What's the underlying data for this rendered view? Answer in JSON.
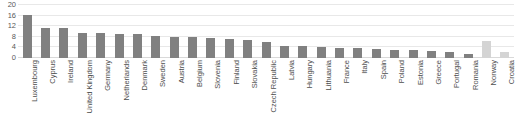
{
  "chart_data": {
    "type": "bar",
    "title": "",
    "subtitle": "",
    "xlabel": "",
    "ylabel": "",
    "ylim": [
      0,
      20
    ],
    "yticks": [
      0,
      4,
      8,
      12,
      16,
      20
    ],
    "grid": true,
    "legend": null,
    "categories": [
      "Luxembourg",
      "Cyprus",
      "Ireland",
      "United Kingdom",
      "Germany",
      "Netherlands",
      "Denmark",
      "Sweden",
      "Austria",
      "Belgium",
      "Slovenia",
      "Finland",
      "Slovakia",
      "Czech Republic",
      "Latvia",
      "Hungary",
      "Lithuania",
      "France",
      "Italy",
      "Spain",
      "Poland",
      "Estonia",
      "Greece",
      "Portugal",
      "Romania",
      "Norway",
      "Croatia"
    ],
    "values": [
      16.3,
      11.3,
      11.3,
      9.6,
      9.3,
      9.2,
      8.9,
      8.2,
      7.9,
      7.8,
      7.4,
      7.0,
      6.7,
      6.2,
      4.6,
      4.4,
      4.3,
      3.9,
      3.7,
      3.4,
      3.2,
      3.1,
      2.6,
      2.3,
      1.6,
      6.3,
      2.2
    ],
    "bar_styles": [
      "dark",
      "dark",
      "dark",
      "dark",
      "dark",
      "dark",
      "dark",
      "dark",
      "dark",
      "dark",
      "dark",
      "dark",
      "dark",
      "dark",
      "dark",
      "dark",
      "dark",
      "dark",
      "dark",
      "dark",
      "dark",
      "dark",
      "dark",
      "dark",
      "dark",
      "light",
      "light"
    ],
    "colors": {
      "bar_dark": "#808080",
      "bar_light": "#d4d4d4",
      "gridline": "#e8e8e8",
      "axis_text": "#595959",
      "label_text": "#4d4d4d",
      "background": "#ffffff"
    }
  }
}
